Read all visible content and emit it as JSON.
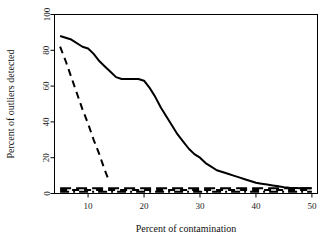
{
  "chart_data": {
    "type": "line",
    "title": "",
    "subtitle": "",
    "xlabel": "Percent of contamination",
    "ylabel": "Percent of outliers detected",
    "xlim": [
      4,
      50
    ],
    "ylim": [
      0,
      100
    ],
    "grid": false,
    "legend": "none",
    "xticks": [
      10,
      20,
      30,
      40,
      50
    ],
    "yticks": [
      0,
      20,
      40,
      60,
      80,
      100
    ],
    "xtick_labels": [
      "10",
      "20",
      "30",
      "40",
      "50"
    ],
    "ytick_labels": [
      "0",
      "20",
      "40",
      "60",
      "80",
      "100"
    ],
    "annotations": [],
    "series": [
      {
        "name": "solid-curve",
        "style": "solid",
        "color": "#000000",
        "width": 2.0,
        "x": [
          5,
          7,
          9,
          10,
          11,
          12,
          13,
          14,
          15,
          16,
          17,
          18,
          19,
          20,
          21,
          22,
          23,
          24,
          25,
          26,
          27,
          28,
          29,
          30,
          31,
          32,
          33,
          34,
          35,
          36,
          37,
          38,
          39,
          40,
          41,
          42,
          43,
          44,
          45,
          46,
          47,
          48,
          49,
          50
        ],
        "values": [
          88,
          86,
          82,
          81,
          78,
          74,
          71,
          68,
          65,
          64,
          64,
          64,
          64,
          63,
          59,
          54,
          48,
          43,
          38,
          33,
          29,
          25,
          22,
          20,
          17,
          15,
          13,
          12,
          11,
          10,
          9,
          8,
          7,
          6,
          5.5,
          5,
          4.5,
          4,
          3.5,
          3.2,
          3.1,
          3,
          3,
          3
        ]
      },
      {
        "name": "dashed-curve",
        "style": "dashed",
        "color": "#000000",
        "width": 2.0,
        "x": [
          5,
          6,
          7,
          8,
          9,
          10,
          11,
          12,
          13,
          13.5
        ],
        "values": [
          82,
          74,
          65,
          56,
          47,
          39,
          30,
          22,
          13,
          9
        ]
      },
      {
        "name": "flat-dashed-baseline-1",
        "style": "dashed",
        "color": "#000000",
        "width": 2.0,
        "x": [
          5,
          10,
          15,
          20,
          25,
          30,
          35,
          40,
          45,
          50
        ],
        "values": [
          2,
          2,
          2,
          2,
          2,
          2,
          2,
          2,
          2,
          2
        ]
      },
      {
        "name": "flat-dashdot-baseline-2",
        "style": "dashdot",
        "color": "#000000",
        "width": 2.0,
        "x": [
          5,
          10,
          15,
          20,
          25,
          30,
          35,
          40,
          45,
          50
        ],
        "values": [
          1,
          1,
          1,
          1,
          1,
          1,
          1,
          1,
          1,
          1
        ]
      },
      {
        "name": "flat-dashed-baseline-3",
        "style": "longdash",
        "color": "#000000",
        "width": 2.0,
        "x": [
          5,
          12,
          18,
          24,
          30,
          36,
          42,
          48,
          50
        ],
        "values": [
          3,
          3,
          3,
          3,
          3,
          3,
          3,
          3,
          3
        ]
      }
    ]
  },
  "axis_style": {
    "frame_color": "#000000",
    "tick_color": "#000000",
    "background": "#ffffff"
  }
}
